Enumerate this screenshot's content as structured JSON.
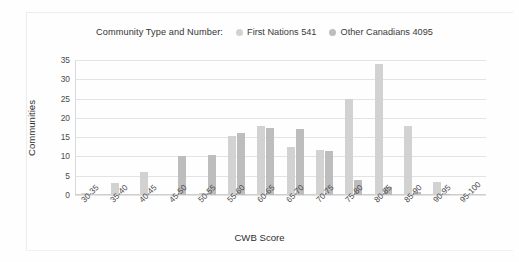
{
  "legend": {
    "title": "Community Type and Number:",
    "entries": [
      {
        "label": "First Nations 541",
        "color": "#d2d2d2"
      },
      {
        "label": "Other Canadians 4095",
        "color": "#bdbdbd"
      }
    ]
  },
  "chart_data": {
    "type": "bar",
    "title": "",
    "xlabel": "CWB Score",
    "ylabel": "Communities",
    "ylim": [
      0,
      35
    ],
    "yticks": [
      0,
      5,
      10,
      15,
      20,
      25,
      30,
      35
    ],
    "grid": true,
    "legend_position": "top",
    "categories": [
      "30-35",
      "35-40",
      "40-45",
      "45-50",
      "50-55",
      "55-60",
      "60-65",
      "65-70",
      "70-75",
      "75-80",
      "80-85",
      "85-90",
      "90-95",
      "95-100"
    ],
    "series": [
      {
        "name": "First Nations 541",
        "color": "#d2d2d2",
        "values": [
          0.5,
          3,
          6,
          0.3,
          0.6,
          15.3,
          18,
          12.4,
          11.7,
          25,
          34,
          18,
          3.4,
          0
        ]
      },
      {
        "name": "Other Canadians 4095",
        "color": "#bdbdbd",
        "values": [
          0,
          0,
          0,
          10,
          10.3,
          16,
          17.5,
          17,
          11.4,
          4,
          2,
          0.8,
          0.3,
          0
        ]
      }
    ]
  }
}
